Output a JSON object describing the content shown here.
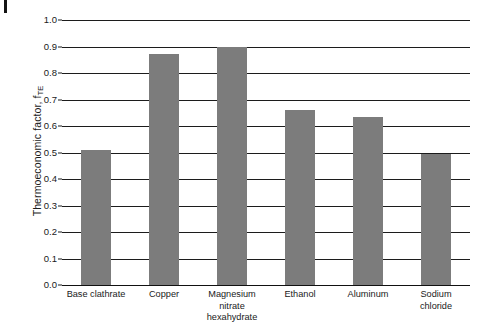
{
  "figure": {
    "edge_mark": "page-edge-artifact"
  },
  "chart_data": {
    "type": "bar",
    "title": "",
    "xlabel": "",
    "ylabel": "Thermoeconomic factor, f",
    "ylabel_subscript": "TE",
    "categories": [
      "Base clathrate",
      "Copper",
      "Magnesium\nnitrate\nhexahydrate",
      "Ethanol",
      "Aluminum",
      "Sodium\nchloride"
    ],
    "category_lines": [
      [
        "Base clathrate"
      ],
      [
        "Copper"
      ],
      [
        "Magnesium",
        "nitrate",
        "hexahydrate"
      ],
      [
        "Ethanol"
      ],
      [
        "Aluminum"
      ],
      [
        "Sodium",
        "chloride"
      ]
    ],
    "values": [
      0.51,
      0.87,
      0.9,
      0.66,
      0.635,
      0.495
    ],
    "ylim": [
      0.0,
      1.0
    ],
    "yticks": [
      "0.0",
      "0.1",
      "0.2",
      "0.3",
      "0.4",
      "0.5",
      "0.6",
      "0.7",
      "0.8",
      "0.9",
      "1.0"
    ],
    "ytick_values": [
      0.0,
      0.1,
      0.2,
      0.3,
      0.4,
      0.5,
      0.6,
      0.7,
      0.8,
      0.9,
      1.0
    ],
    "grid": true,
    "legend": false,
    "bar_color": "#7c7c7c",
    "axis_color": "#1c1c1c"
  }
}
